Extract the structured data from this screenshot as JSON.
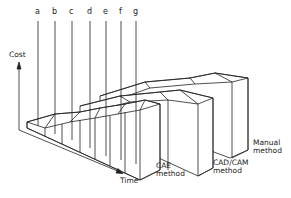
{
  "figure": {
    "axes": {
      "y_label": "Cost",
      "x_label": "Time"
    },
    "stages": [
      "a",
      "b",
      "c",
      "d",
      "e",
      "f",
      "g"
    ],
    "methods": [
      {
        "id": "cae",
        "label_line1": "CAE",
        "label_line2": "method"
      },
      {
        "id": "cadcam",
        "label_line1": "CAD/CAM",
        "label_line2": "method"
      },
      {
        "id": "manual",
        "label_line1": "Manual",
        "label_line2": "method"
      }
    ],
    "colors": {
      "line": "#222222",
      "background": "#ffffff"
    }
  }
}
